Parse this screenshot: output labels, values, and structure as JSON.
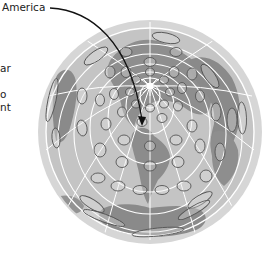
{
  "figure": {
    "callout_label": "America",
    "left_text_fragments": [
      "ar",
      "o",
      "nt"
    ]
  },
  "colors": {
    "ocean": "#c8c8c8",
    "ocean_rim": "#d9d9d9",
    "land": "#8f8f8f",
    "land_dark": "#7a7a7a",
    "grid": "#ffffff",
    "ellipse_stroke": "#555555",
    "arrow": "#111111"
  },
  "map": {
    "projection": "azimuthal (polar-centered) with Tissot indicatrices",
    "center": [
      150,
      132
    ],
    "radius": 112
  }
}
